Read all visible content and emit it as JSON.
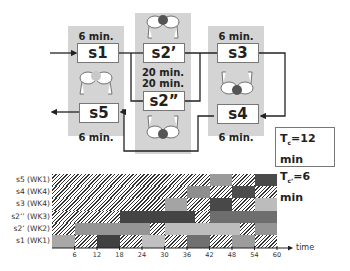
{
  "diagram": {
    "stations": [
      {
        "id": "s1",
        "label": "s1",
        "time": "6 min."
      },
      {
        "id": "s2a",
        "label": "s2’",
        "time": "20 min."
      },
      {
        "id": "s2b",
        "label": "s2”",
        "time": "20 min."
      },
      {
        "id": "s3",
        "label": "s3",
        "time": "6 min."
      },
      {
        "id": "s4",
        "label": "s4",
        "time": "6 min."
      },
      {
        "id": "s5",
        "label": "s5",
        "time": "6 min."
      }
    ],
    "cycle_times": {
      "tc_prefix": "T",
      "tc_sub": "c",
      "tc_value": "=12 min",
      "tc2_prefix": "T",
      "tc2_sub": "c’",
      "tc2_value": "=6 min"
    },
    "icons": [
      "worker-icon-s1-s5",
      "worker-icon-s2a",
      "worker-icon-s2b",
      "worker-icon-s3-s4"
    ]
  },
  "chart_data": {
    "type": "gantt",
    "title": "",
    "xlabel": "time",
    "xticks": [
      6,
      12,
      18,
      24,
      30,
      36,
      42,
      48,
      54,
      60
    ],
    "xlim": [
      0,
      60
    ],
    "rows": [
      {
        "label": "s5 (WK1)",
        "segments": [
          {
            "start": 0,
            "end": 42,
            "fill": "hatch"
          },
          {
            "start": 42,
            "end": 48,
            "fill": "#9a9a9a"
          },
          {
            "start": 48,
            "end": 54,
            "fill": "hatch"
          },
          {
            "start": 54,
            "end": 60,
            "fill": "#4a4a4a"
          }
        ]
      },
      {
        "label": "s4 (WK4)",
        "segments": [
          {
            "start": 0,
            "end": 36,
            "fill": "hatch"
          },
          {
            "start": 36,
            "end": 42,
            "fill": "#8e8e8e"
          },
          {
            "start": 42,
            "end": 48,
            "fill": "hatch"
          },
          {
            "start": 48,
            "end": 54,
            "fill": "#4c4c4c"
          },
          {
            "start": 54,
            "end": 60,
            "fill": "hatch"
          }
        ]
      },
      {
        "label": "s3 (WK4)",
        "segments": [
          {
            "start": 0,
            "end": 30,
            "fill": "hatch"
          },
          {
            "start": 30,
            "end": 36,
            "fill": "#a4a4a4"
          },
          {
            "start": 36,
            "end": 42,
            "fill": "hatch"
          },
          {
            "start": 42,
            "end": 48,
            "fill": "#484848"
          },
          {
            "start": 48,
            "end": 54,
            "fill": "hatch"
          },
          {
            "start": 54,
            "end": 60,
            "fill": "#bcbcbc"
          }
        ]
      },
      {
        "label": "s2’’ (WK3)",
        "segments": [
          {
            "start": 0,
            "end": 18,
            "fill": "hatch"
          },
          {
            "start": 18,
            "end": 38,
            "fill": "#444444"
          },
          {
            "start": 38,
            "end": 42,
            "fill": "hatch"
          },
          {
            "start": 42,
            "end": 60,
            "fill": "#6e6e6e"
          }
        ]
      },
      {
        "label": "s2’ (WK2)",
        "segments": [
          {
            "start": 0,
            "end": 6,
            "fill": "hatch"
          },
          {
            "start": 6,
            "end": 26,
            "fill": "#959595"
          },
          {
            "start": 26,
            "end": 30,
            "fill": "hatch"
          },
          {
            "start": 30,
            "end": 50,
            "fill": "#bdbdbd"
          },
          {
            "start": 50,
            "end": 54,
            "fill": "hatch"
          },
          {
            "start": 54,
            "end": 60,
            "fill": "#959595"
          }
        ]
      },
      {
        "label": "s1 (WK1)",
        "segments": [
          {
            "start": 0,
            "end": 6,
            "fill": "#a8a8a8"
          },
          {
            "start": 6,
            "end": 12,
            "fill": "hatch"
          },
          {
            "start": 12,
            "end": 18,
            "fill": "#404040"
          },
          {
            "start": 18,
            "end": 24,
            "fill": "hatch"
          },
          {
            "start": 24,
            "end": 30,
            "fill": "#c0c0c0"
          },
          {
            "start": 30,
            "end": 36,
            "fill": "hatch"
          },
          {
            "start": 36,
            "end": 42,
            "fill": "#707070"
          },
          {
            "start": 42,
            "end": 48,
            "fill": "hatch"
          },
          {
            "start": 48,
            "end": 54,
            "fill": "#9c9c9c"
          },
          {
            "start": 54,
            "end": 60,
            "fill": "hatch"
          }
        ]
      }
    ],
    "legend": "hatch = idle; shaded = working"
  }
}
